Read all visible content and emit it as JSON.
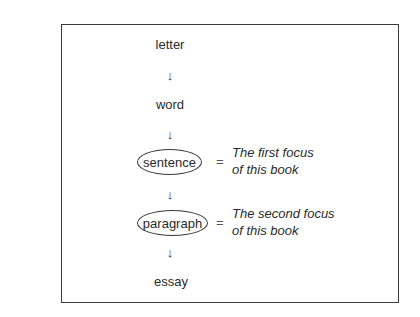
{
  "diagram": {
    "nodes": [
      {
        "id": "letter",
        "label": "letter",
        "circled": false
      },
      {
        "id": "word",
        "label": "word",
        "circled": false
      },
      {
        "id": "sentence",
        "label": "sentence",
        "circled": true
      },
      {
        "id": "paragraph",
        "label": "paragraph",
        "circled": true
      },
      {
        "id": "essay",
        "label": "essay",
        "circled": false
      }
    ],
    "edges": [
      {
        "from": "letter",
        "to": "word"
      },
      {
        "from": "word",
        "to": "sentence"
      },
      {
        "from": "sentence",
        "to": "paragraph"
      },
      {
        "from": "paragraph",
        "to": "essay"
      }
    ],
    "arrow_glyph": "↓",
    "equals_glyph": "=",
    "annotations": [
      {
        "node": "sentence",
        "line1": "The first focus",
        "line2": "of this book"
      },
      {
        "node": "paragraph",
        "line1": "The second focus",
        "line2": "of this book"
      }
    ]
  }
}
